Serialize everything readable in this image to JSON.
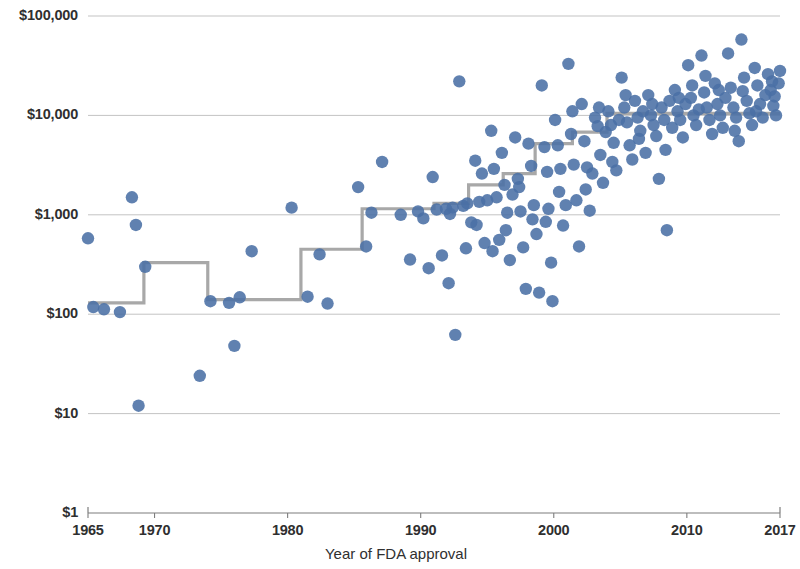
{
  "chart_data": {
    "type": "scatter",
    "title": "",
    "xlabel": "Year of FDA approval",
    "ylabel": "",
    "xlim": [
      1965,
      2017
    ],
    "ylim": [
      1,
      100000
    ],
    "yscale": "log",
    "grid": true,
    "legend": false,
    "axis_color": "#8a8a8a",
    "grid_color": "#b9b9b9",
    "point_color": "#4a6fa5",
    "step_color": "#a8a8a8",
    "x_ticks": [
      1965,
      1970,
      1980,
      1990,
      2000,
      2010,
      2017
    ],
    "x_tick_labels": [
      "1965",
      "1970",
      "1980",
      "1990",
      "2000",
      "2010",
      "2017"
    ],
    "y_ticks": [
      1,
      10,
      100,
      1000,
      10000,
      100000
    ],
    "y_tick_labels": [
      "$1",
      "$10",
      "$100",
      "$1,000",
      "$10,000",
      "$100,000"
    ],
    "series_name": "Launch price of FDA-approved drug",
    "points": [
      [
        1965,
        580
      ],
      [
        1965.4,
        118
      ],
      [
        1966.2,
        112
      ],
      [
        1967.4,
        105
      ],
      [
        1968.3,
        1500
      ],
      [
        1968.6,
        790
      ],
      [
        1968.8,
        12
      ],
      [
        1969.3,
        300
      ],
      [
        1973.4,
        24
      ],
      [
        1974.2,
        135
      ],
      [
        1975.6,
        130
      ],
      [
        1976.0,
        48
      ],
      [
        1976.4,
        148
      ],
      [
        1977.3,
        430
      ],
      [
        1980.3,
        1180
      ],
      [
        1981.5,
        150
      ],
      [
        1982.4,
        400
      ],
      [
        1983.0,
        128
      ],
      [
        1985.3,
        1900
      ],
      [
        1985.9,
        480
      ],
      [
        1986.3,
        1050
      ],
      [
        1987.1,
        3400
      ],
      [
        1988.5,
        1000
      ],
      [
        1989.2,
        355
      ],
      [
        1989.8,
        1080
      ],
      [
        1990.2,
        920
      ],
      [
        1990.6,
        290
      ],
      [
        1990.9,
        2400
      ],
      [
        1991.2,
        1130
      ],
      [
        1991.6,
        390
      ],
      [
        1991.9,
        1150
      ],
      [
        1992.1,
        205
      ],
      [
        1992.4,
        1180
      ],
      [
        1992.6,
        62
      ],
      [
        1992.9,
        22000
      ],
      [
        1993.2,
        1230
      ],
      [
        1993.5,
        1300
      ],
      [
        1993.8,
        840
      ],
      [
        1994.1,
        3500
      ],
      [
        1994.4,
        1350
      ],
      [
        1994.6,
        2600
      ],
      [
        1994.8,
        520
      ],
      [
        1995.0,
        1400
      ],
      [
        1995.3,
        7000
      ],
      [
        1995.5,
        2900
      ],
      [
        1995.7,
        1500
      ],
      [
        1995.9,
        560
      ],
      [
        1996.1,
        4200
      ],
      [
        1996.3,
        2000
      ],
      [
        1996.5,
        1050
      ],
      [
        1996.7,
        350
      ],
      [
        1996.9,
        1600
      ],
      [
        1997.1,
        6000
      ],
      [
        1997.3,
        2300
      ],
      [
        1997.5,
        1080
      ],
      [
        1997.7,
        470
      ],
      [
        1997.9,
        180
      ],
      [
        1998.1,
        5200
      ],
      [
        1998.3,
        3100
      ],
      [
        1998.5,
        1250
      ],
      [
        1998.7,
        640
      ],
      [
        1998.9,
        165
      ],
      [
        1999.1,
        20000
      ],
      [
        1999.3,
        4800
      ],
      [
        1999.5,
        2700
      ],
      [
        1999.6,
        1150
      ],
      [
        1999.8,
        330
      ],
      [
        1999.9,
        135
      ],
      [
        2000.1,
        9000
      ],
      [
        2000.3,
        5000
      ],
      [
        2000.5,
        2900
      ],
      [
        2000.7,
        780
      ],
      [
        2000.9,
        1250
      ],
      [
        2001.1,
        33000
      ],
      [
        2001.3,
        6500
      ],
      [
        2001.5,
        3200
      ],
      [
        2001.7,
        1400
      ],
      [
        2001.9,
        480
      ],
      [
        2002.1,
        13000
      ],
      [
        2002.3,
        5500
      ],
      [
        2002.5,
        3000
      ],
      [
        2002.7,
        1100
      ],
      [
        2002.9,
        2600
      ],
      [
        2003.1,
        9500
      ],
      [
        2003.3,
        7800
      ],
      [
        2003.5,
        4000
      ],
      [
        2003.7,
        2100
      ],
      [
        2003.9,
        6800
      ],
      [
        2004.1,
        11000
      ],
      [
        2004.3,
        8000
      ],
      [
        2004.5,
        5300
      ],
      [
        2004.7,
        2800
      ],
      [
        2004.9,
        9000
      ],
      [
        2005.1,
        24000
      ],
      [
        2005.3,
        12000
      ],
      [
        2005.5,
        8500
      ],
      [
        2005.7,
        5000
      ],
      [
        2005.9,
        3600
      ],
      [
        2006.1,
        14000
      ],
      [
        2006.3,
        9500
      ],
      [
        2006.5,
        7000
      ],
      [
        2006.7,
        11000
      ],
      [
        2006.9,
        4200
      ],
      [
        2007.1,
        16000
      ],
      [
        2007.3,
        10000
      ],
      [
        2007.5,
        8000
      ],
      [
        2007.7,
        6200
      ],
      [
        2007.9,
        2300
      ],
      [
        2008.1,
        12000
      ],
      [
        2008.3,
        9000
      ],
      [
        2008.5,
        700
      ],
      [
        2008.7,
        14000
      ],
      [
        2008.9,
        7500
      ],
      [
        2009.1,
        18000
      ],
      [
        2009.3,
        11000
      ],
      [
        2009.5,
        9000
      ],
      [
        2009.7,
        6000
      ],
      [
        2009.9,
        13000
      ],
      [
        2010.1,
        32000
      ],
      [
        2010.3,
        15000
      ],
      [
        2010.5,
        10000
      ],
      [
        2010.7,
        8000
      ],
      [
        2010.9,
        11500
      ],
      [
        2011.1,
        40000
      ],
      [
        2011.3,
        17000
      ],
      [
        2011.5,
        12000
      ],
      [
        2011.7,
        9000
      ],
      [
        2011.9,
        6500
      ],
      [
        2012.1,
        21000
      ],
      [
        2012.3,
        13000
      ],
      [
        2012.5,
        10000
      ],
      [
        2012.7,
        7500
      ],
      [
        2012.9,
        15000
      ],
      [
        2013.1,
        42000
      ],
      [
        2013.3,
        19000
      ],
      [
        2013.5,
        12000
      ],
      [
        2013.7,
        9500
      ],
      [
        2013.9,
        5500
      ],
      [
        2014.1,
        58000
      ],
      [
        2014.3,
        24000
      ],
      [
        2014.5,
        14000
      ],
      [
        2014.7,
        10500
      ],
      [
        2014.9,
        8000
      ],
      [
        2015.1,
        30000
      ],
      [
        2015.3,
        20000
      ],
      [
        2015.5,
        13000
      ],
      [
        2015.7,
        9500
      ],
      [
        2015.9,
        16000
      ],
      [
        2016.1,
        26000
      ],
      [
        2016.3,
        18000
      ],
      [
        2016.5,
        12500
      ],
      [
        2016.7,
        10000
      ],
      [
        2016.9,
        21000
      ],
      [
        2017.0,
        28000
      ],
      [
        2016.4,
        22000
      ],
      [
        2016.6,
        15500
      ],
      [
        2015.2,
        11000
      ],
      [
        2014.2,
        17500
      ],
      [
        2013.6,
        7000
      ],
      [
        2012.4,
        18000
      ],
      [
        2011.4,
        25000
      ],
      [
        2010.4,
        20000
      ],
      [
        2009.4,
        15000
      ],
      [
        2008.4,
        4500
      ],
      [
        2007.4,
        13000
      ],
      [
        2006.4,
        5800
      ],
      [
        2005.4,
        16000
      ],
      [
        2004.4,
        3400
      ],
      [
        2003.4,
        12000
      ],
      [
        2002.4,
        1800
      ],
      [
        2001.4,
        11000
      ],
      [
        2000.4,
        1700
      ],
      [
        1999.4,
        850
      ],
      [
        1998.4,
        900
      ],
      [
        1997.4,
        1900
      ],
      [
        1996.4,
        700
      ],
      [
        1995.4,
        430
      ],
      [
        1994.2,
        790
      ],
      [
        1993.4,
        460
      ],
      [
        1992.2,
        1020
      ]
    ],
    "step_line": {
      "name": "Median launch price by era",
      "points": [
        [
          1965,
          130
        ],
        [
          1969.2,
          130
        ],
        [
          1969.2,
          330
        ],
        [
          1974.0,
          330
        ],
        [
          1974.0,
          140
        ],
        [
          1981.0,
          140
        ],
        [
          1981.0,
          450
        ],
        [
          1985.6,
          450
        ],
        [
          1985.6,
          1150
        ],
        [
          1991.0,
          1150
        ],
        [
          1991.0,
          1300
        ],
        [
          1993.6,
          1300
        ],
        [
          1993.6,
          2000
        ],
        [
          1996.2,
          2000
        ],
        [
          1996.2,
          2600
        ],
        [
          1998.6,
          2600
        ],
        [
          1998.6,
          5200
        ],
        [
          2001.4,
          5200
        ],
        [
          2001.4,
          6800
        ],
        [
          2004.0,
          6800
        ],
        [
          2004.0,
          10500
        ],
        [
          2017,
          10500
        ]
      ]
    }
  }
}
